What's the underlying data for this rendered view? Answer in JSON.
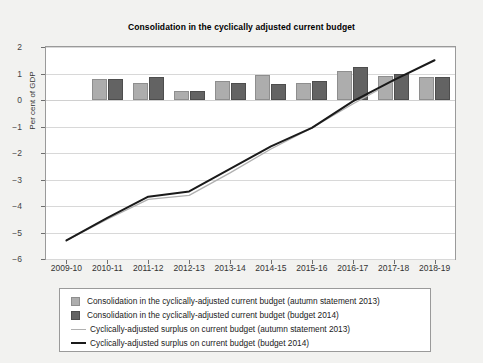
{
  "chart_data": {
    "type": "bar",
    "title": "Consolidation in the cyclically adjusted current budget",
    "xlabel": "",
    "ylabel": "Per cent of GDP",
    "ylim": [
      -6,
      2
    ],
    "yticks": [
      2,
      1,
      0,
      -1,
      -2,
      -3,
      -4,
      -5,
      -6
    ],
    "grid": true,
    "legend_position": "below",
    "categories": [
      "2009-10",
      "2010-11",
      "2011-12",
      "2012-13",
      "2013-14",
      "2014-15",
      "2015-16",
      "2016-17",
      "2017-18",
      "2018-19"
    ],
    "series": [
      {
        "name": "Consolidation in the cyclically-adjusted current budget (autumn statement 2013)",
        "type": "bar",
        "color": "#adadad",
        "values": [
          null,
          0.8,
          0.65,
          0.35,
          0.7,
          0.95,
          0.65,
          1.1,
          0.92,
          0.85
        ]
      },
      {
        "name": "Consolidation in the cyclically-adjusted current budget (budget 2014)",
        "type": "bar",
        "color": "#636363",
        "values": [
          null,
          0.8,
          0.85,
          0.35,
          0.65,
          0.6,
          0.72,
          1.25,
          0.98,
          0.85
        ]
      },
      {
        "name": "Cyclically-adjusted surplus on current budget (autumn statement 2013)",
        "type": "line",
        "color": "#b0b0b0",
        "values": [
          -5.3,
          -4.5,
          -3.75,
          -3.6,
          -2.75,
          -1.85,
          -1.05,
          -0.15,
          0.7,
          null
        ]
      },
      {
        "name": "Cyclically-adjusted surplus on current budget (budget 2014)",
        "type": "line",
        "color": "#1a1a1a",
        "values": [
          -5.3,
          -4.45,
          -3.65,
          -3.45,
          -2.6,
          -1.75,
          -1.05,
          -0.05,
          0.75,
          1.5
        ]
      }
    ]
  },
  "legend": {
    "items": [
      {
        "label": "Consolidation in the cyclically-adjusted current budget (autumn statement 2013)",
        "marker": "light-square"
      },
      {
        "label": "Consolidation in the cyclically-adjusted current budget (budget 2014)",
        "marker": "dark-square"
      },
      {
        "label": "Cyclically-adjusted surplus on current budget (autumn statement 2013)",
        "marker": "thin-line"
      },
      {
        "label": "Cyclically-adjusted surplus on current budget (budget 2014)",
        "marker": "thick-line"
      }
    ]
  }
}
